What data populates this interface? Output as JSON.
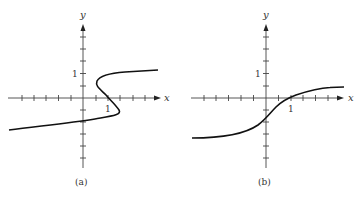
{
  "figure": {
    "panels": [
      {
        "id": "a",
        "caption": "(a)",
        "x_axis_label": "x",
        "y_axis_label": "y",
        "x_tick_label": "1",
        "y_tick_label": "1",
        "description": "S-shaped curve that is not a function of x (fails vertical line test)"
      },
      {
        "id": "b",
        "caption": "(b)",
        "x_axis_label": "x",
        "y_axis_label": "y",
        "x_tick_label": "1",
        "y_tick_label": "1",
        "description": "Increasing sigmoid-like curve (function of x)"
      }
    ],
    "colors": {
      "curve": "#111111",
      "axis": "#333333",
      "background": "#ffffff"
    }
  }
}
